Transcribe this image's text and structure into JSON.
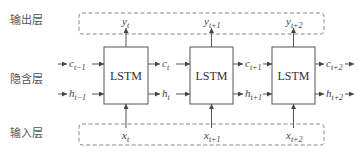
{
  "layers": {
    "output": "输出层",
    "hidden": "隐含层",
    "input": "输入层"
  },
  "cells": [
    {
      "label": "LSTM",
      "output": {
        "base": "y",
        "sub": "t"
      },
      "input": {
        "base": "x",
        "sub": "t"
      },
      "c_out": {
        "base": "c",
        "sub": "t"
      },
      "h_out": {
        "base": "h",
        "sub": "t"
      }
    },
    {
      "label": "LSTM",
      "output": {
        "base": "y",
        "sub": "t+1"
      },
      "input": {
        "base": "x",
        "sub": "t+1"
      },
      "c_out": {
        "base": "c",
        "sub": "t+1"
      },
      "h_out": {
        "base": "h",
        "sub": "t+1"
      }
    },
    {
      "label": "LSTM",
      "output": {
        "base": "y",
        "sub": "t+2"
      },
      "input": {
        "base": "x",
        "sub": "t+2"
      },
      "c_out": {
        "base": "c",
        "sub": "t+2"
      },
      "h_out": {
        "base": "h",
        "sub": "t+2"
      }
    }
  ],
  "initial_state": {
    "c": {
      "base": "c",
      "sub": "t−1"
    },
    "h": {
      "base": "h",
      "sub": "t−1"
    }
  }
}
